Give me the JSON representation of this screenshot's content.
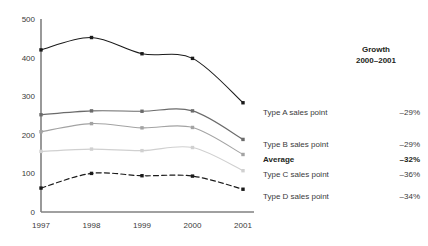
{
  "chart_data": {
    "type": "line",
    "title": "",
    "xlabel": "",
    "ylabel": "",
    "categories": [
      "1997",
      "1998",
      "1999",
      "2000",
      "2001"
    ],
    "yticks": [
      0,
      100,
      200,
      300,
      400,
      500
    ],
    "ylim": [
      0,
      500
    ],
    "grid": false,
    "legend_position": "right",
    "series": [
      {
        "name": "Type A sales point",
        "values": [
          420,
          452,
          410,
          398,
          283
        ],
        "color": "#1a1a1a",
        "style": "solid",
        "growth": "–29%"
      },
      {
        "name": "Type B sales point",
        "values": [
          252,
          262,
          261,
          262,
          188
        ],
        "color": "#6b6b6b",
        "style": "solid",
        "growth": "–29%"
      },
      {
        "name": "Average",
        "values": [
          208,
          229,
          218,
          219,
          149
        ],
        "color": "#a3a3a3",
        "style": "solid",
        "growth": "–32%"
      },
      {
        "name": "Type C sales point",
        "values": [
          157,
          163,
          159,
          167,
          107
        ],
        "color": "#d0d0d0",
        "style": "solid",
        "growth": "–36%"
      },
      {
        "name": "Type D sales point",
        "values": [
          62,
          100,
          94,
          93,
          59
        ],
        "color": "#1a1a1a",
        "style": "dashed",
        "growth": "–34%"
      }
    ]
  },
  "axes": {
    "y_tick_labels": [
      "500",
      "400",
      "300",
      "200",
      "100",
      "0"
    ],
    "x_tick_labels": [
      "1997",
      "1998",
      "1999",
      "2000",
      "2001"
    ]
  },
  "legend": {
    "header_line1": "Growth",
    "header_line2": "2000–2001",
    "rows": [
      {
        "label": "Type A sales point",
        "growth": "–29%",
        "bold": false
      },
      {
        "label": "Type B sales point",
        "growth": "–29%",
        "bold": false
      },
      {
        "label": "Average",
        "growth": "–32%",
        "bold": true
      },
      {
        "label": "Type C sales point",
        "growth": "–36%",
        "bold": false
      },
      {
        "label": "Type D sales point",
        "growth": "–34%",
        "bold": false
      }
    ]
  },
  "colors": {
    "axis": "#808080",
    "text": "#3a3a3a",
    "background": "#ffffff"
  }
}
